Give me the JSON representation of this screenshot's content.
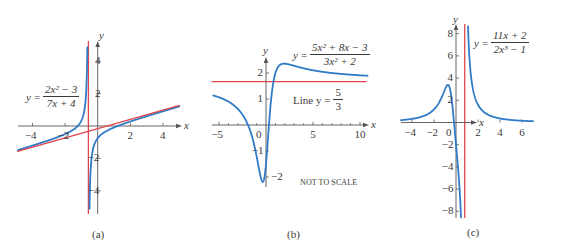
{
  "colors": {
    "curve": "#2f7bc8",
    "asymptote": "#e0454b",
    "axis": "#555555",
    "text": "#3a3a3a"
  },
  "chart_data": [
    {
      "id": "a",
      "type": "line",
      "caption": "(a)",
      "title": "y = (2x^2 - 3)/(7x + 4)",
      "formula": {
        "lhs": "y",
        "numerator": "2x² − 3",
        "denominator": "7x + 4"
      },
      "xlabel": "x",
      "ylabel": "y",
      "xticks": [
        -4,
        -2,
        2,
        4
      ],
      "yticks": [
        -4,
        -2,
        2,
        4
      ],
      "xtick_labels": [
        "−4",
        "−2",
        "2",
        "4"
      ],
      "ytick_labels": [
        "−4",
        "−2",
        "2",
        "4"
      ],
      "xlim": [
        -4.9,
        5.0
      ],
      "ylim": [
        -5.4,
        5.2
      ],
      "series": [
        {
          "name": "y = (2x^2 - 3)/(7x + 4)",
          "color": "curve",
          "role": "function",
          "expr": "(2*x*x-3)/(7*x+4)",
          "xrange": [
            -4.9,
            5.0
          ],
          "pole": -0.5714
        },
        {
          "name": "Oblique asymptote y = (2/7)x - 8/49",
          "color": "asymptote",
          "role": "oblique",
          "expr": "(2/7)*x-8/49",
          "xrange": [
            -4.9,
            5.0
          ]
        },
        {
          "name": "Vertical asymptote x = -4/7",
          "color": "asymptote",
          "role": "vertical",
          "x": -0.5714
        }
      ],
      "layout": {
        "ox": 97.7,
        "oy": 126,
        "sx": 16.3,
        "sy": 16.2,
        "xaxis_px": [
          18,
          182
        ],
        "yaxis_px": [
          41,
          214
        ],
        "formula_pos": [
          26,
          84
        ],
        "caption_pos": [
          92,
          228
        ],
        "xlabel_pos": [
          184,
          120
        ],
        "ylabel_pos": [
          99,
          30
        ],
        "tick_style": "both"
      }
    },
    {
      "id": "b",
      "type": "line",
      "caption": "(b)",
      "title": "y = (5x^2 + 8x - 3)/(3x^2 + 2)",
      "formula": {
        "lhs": "y",
        "numerator": "5x² + 8x − 3",
        "denominator": "3x² + 2"
      },
      "annotation_line": {
        "prefix": "Line y =",
        "numerator": "5",
        "denominator": "3"
      },
      "note": "NOT TO SCALE",
      "xlabel": "x",
      "ylabel": "y",
      "xticks": [
        -5,
        0,
        5,
        10
      ],
      "yticks": [
        -2,
        -1,
        1,
        2
      ],
      "xtick_labels": [
        "−5",
        "0",
        "5",
        "10"
      ],
      "ytick_labels": [
        "−2",
        "−1",
        "1",
        "2"
      ],
      "minor_xticks": [
        -4,
        -3,
        -2,
        -1,
        1,
        2,
        3,
        4,
        6,
        7,
        8,
        9
      ],
      "xlim": [
        -5.8,
        10.8
      ],
      "ylim": [
        -2.3,
        2.6
      ],
      "series": [
        {
          "name": "y = (5x^2 + 8x - 3)/(3x^2 + 2)",
          "color": "curve",
          "role": "function",
          "expr": "(5*x*x+8*x-3)/(3*x*x+2)",
          "xrange": [
            -5.6,
            10.8
          ]
        },
        {
          "name": "Horizontal asymptote y = 5/3",
          "color": "asymptote",
          "role": "horizontal",
          "y": 1.6667,
          "xrange": [
            -5.8,
            10.7
          ]
        }
      ],
      "layout": {
        "ox": 266,
        "oy": 125,
        "sx": 9.4,
        "sy": 26,
        "xaxis_px": [
          212,
          369
        ],
        "yaxis_px": [
          57,
          187
        ],
        "formula_pos": [
          293,
          42
        ],
        "annotation_pos": [
          293,
          87
        ],
        "note_pos": [
          300,
          178
        ],
        "caption_pos": [
          287,
          228
        ],
        "xlabel_pos": [
          371,
          119
        ],
        "ylabel_pos": [
          263,
          45
        ],
        "tick_style": "left"
      }
    },
    {
      "id": "c",
      "type": "line",
      "caption": "(c)",
      "title": "y = (11x + 2)/(2x^3 - 1)",
      "formula": {
        "lhs": "y",
        "numerator": "11x + 2",
        "denominator": "2x³ − 1"
      },
      "xlabel": "x",
      "ylabel": "y",
      "xticks": [
        -4,
        -2,
        0,
        2,
        4,
        6
      ],
      "yticks": [
        -8,
        -6,
        -4,
        -2,
        2,
        4,
        6,
        8
      ],
      "xtick_labels": [
        "−4",
        "−2",
        "0",
        "2",
        "4",
        "6"
      ],
      "ytick_labels": [
        "−8",
        "−6",
        "−4",
        "−2",
        "2",
        "4",
        "6",
        "8"
      ],
      "xlim": [
        -5.0,
        7.0
      ],
      "ylim": [
        -8.6,
        8.9
      ],
      "series": [
        {
          "name": "y = (11x + 2)/(2x^3 - 1)",
          "color": "curve",
          "role": "function",
          "expr": "(11*x+2)/(2*x*x*x-1)",
          "xrange": [
            -5.0,
            7.0
          ],
          "pole": 0.7937
        },
        {
          "name": "Vertical asymptote x = (1/2)^(1/3)",
          "color": "asymptote",
          "role": "vertical",
          "x": 0.7937
        }
      ],
      "layout": {
        "ox": 456,
        "oy": 122.5,
        "sx": 11,
        "sy": 11.1,
        "xaxis_px": [
          401,
          477
        ],
        "yaxis_px": [
          24,
          218
        ],
        "formula_pos": [
          474,
          30
        ],
        "caption_pos": [
          467,
          226
        ],
        "xlabel_pos": [
          479,
          117
        ],
        "ylabel_pos": [
          453,
          14
        ],
        "tick_style": "left"
      }
    }
  ]
}
